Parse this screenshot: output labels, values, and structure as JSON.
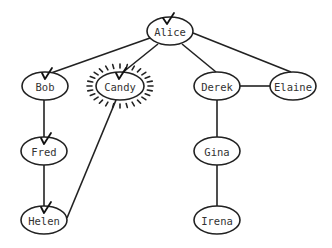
{
  "diagram": {
    "type": "graph",
    "nodes": [
      {
        "id": "alice",
        "label": "Alice",
        "x": 170,
        "y": 31,
        "rx": 23,
        "ry": 14,
        "checked": true,
        "highlighted": false
      },
      {
        "id": "bob",
        "label": "Bob",
        "x": 45,
        "y": 86,
        "rx": 23,
        "ry": 14,
        "checked": true,
        "highlighted": false
      },
      {
        "id": "candy",
        "label": "Candy",
        "x": 120,
        "y": 86,
        "rx": 24,
        "ry": 14,
        "checked": true,
        "highlighted": true
      },
      {
        "id": "derek",
        "label": "Derek",
        "x": 217,
        "y": 86,
        "rx": 23,
        "ry": 14,
        "checked": false,
        "highlighted": false
      },
      {
        "id": "elaine",
        "label": "Elaine",
        "x": 293,
        "y": 86,
        "rx": 23,
        "ry": 14,
        "checked": false,
        "highlighted": false
      },
      {
        "id": "fred",
        "label": "Fred",
        "x": 44,
        "y": 151,
        "rx": 23,
        "ry": 14,
        "checked": true,
        "highlighted": false
      },
      {
        "id": "gina",
        "label": "Gina",
        "x": 217,
        "y": 151,
        "rx": 23,
        "ry": 14,
        "checked": false,
        "highlighted": false
      },
      {
        "id": "helen",
        "label": "Helen",
        "x": 44,
        "y": 220,
        "rx": 23,
        "ry": 14,
        "checked": true,
        "highlighted": false
      },
      {
        "id": "irena",
        "label": "Irena",
        "x": 217,
        "y": 220,
        "rx": 23,
        "ry": 14,
        "checked": false,
        "highlighted": false
      }
    ],
    "edges": [
      {
        "from": "alice",
        "to": "bob"
      },
      {
        "from": "alice",
        "to": "candy"
      },
      {
        "from": "alice",
        "to": "derek"
      },
      {
        "from": "alice",
        "to": "elaine"
      },
      {
        "from": "derek",
        "to": "elaine"
      },
      {
        "from": "bob",
        "to": "fred"
      },
      {
        "from": "fred",
        "to": "helen"
      },
      {
        "from": "candy",
        "to": "helen"
      },
      {
        "from": "derek",
        "to": "gina"
      },
      {
        "from": "gina",
        "to": "irena"
      }
    ],
    "colors": {
      "stroke": "#222222",
      "label": "#333333",
      "background": "#ffffff"
    }
  }
}
